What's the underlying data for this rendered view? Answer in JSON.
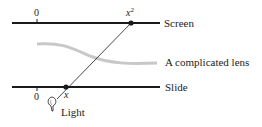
{
  "diagram": {
    "screen": {
      "label": "Screen",
      "zero_label": "0",
      "point_label_base": "x",
      "point_label_exp": "2"
    },
    "lens": {
      "label": "A complicated lens"
    },
    "slide": {
      "label": "Slide",
      "zero_label": "0",
      "point_label": "x"
    },
    "light": {
      "label": "Light"
    },
    "colors": {
      "line": "#1a1a1a",
      "lens": "#c8c8c8",
      "text": "#222222"
    }
  }
}
